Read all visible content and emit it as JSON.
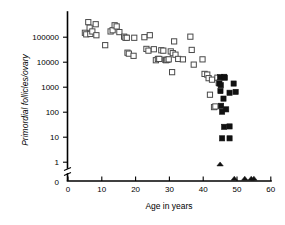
{
  "chart_data": {
    "type": "scatter",
    "title": "",
    "subtitle": "",
    "xlabel": "Age in years",
    "ylabel": "Primordial follicles/ovary",
    "xlim": [
      0,
      60
    ],
    "ylim": [
      0,
      1000000
    ],
    "yscale": "log",
    "y_axis_break": true,
    "y_break_note": "axis broken between 0 and 1",
    "grid": false,
    "legend_position": "none",
    "xticks": [
      0,
      10,
      20,
      30,
      40,
      50,
      60
    ],
    "xticklabels": [
      "0",
      "10",
      "20",
      "30",
      "40",
      "50",
      "60"
    ],
    "yticks": [
      1,
      10,
      100,
      1000,
      10000,
      100000
    ],
    "yticklabels": [
      "1",
      "10",
      "100",
      "1000",
      "10000",
      "100000"
    ],
    "y_zero_label": "0",
    "series": [
      {
        "name": "open-squares",
        "marker": "open-square",
        "color": "#4a4a4a",
        "points": [
          [
            5.0,
            150000
          ],
          [
            5.4,
            130000
          ],
          [
            6.0,
            400000
          ],
          [
            6.4,
            240000
          ],
          [
            6.6,
            135000
          ],
          [
            7.2,
            170000
          ],
          [
            8.2,
            330000
          ],
          [
            8.4,
            120000
          ],
          [
            11.0,
            48000
          ],
          [
            12.6,
            170000
          ],
          [
            13.2,
            190000
          ],
          [
            13.8,
            300000
          ],
          [
            14.4,
            270000
          ],
          [
            15.2,
            160000
          ],
          [
            16.6,
            105000
          ],
          [
            17.0,
            95000
          ],
          [
            17.4,
            95000
          ],
          [
            17.6,
            24000
          ],
          [
            18.0,
            22000
          ],
          [
            19.4,
            18000
          ],
          [
            19.6,
            95000
          ],
          [
            22.6,
            100000
          ],
          [
            23.2,
            34000
          ],
          [
            23.8,
            29000
          ],
          [
            24.2,
            120000
          ],
          [
            25.4,
            33000
          ],
          [
            26.0,
            12000
          ],
          [
            26.6,
            13500
          ],
          [
            27.0,
            13500
          ],
          [
            27.6,
            30000
          ],
          [
            28.2,
            29000
          ],
          [
            28.8,
            12500
          ],
          [
            29.0,
            12000
          ],
          [
            29.4,
            12500
          ],
          [
            29.8,
            13000
          ],
          [
            30.4,
            27000
          ],
          [
            30.8,
            4000
          ],
          [
            31.0,
            23000
          ],
          [
            31.4,
            68000
          ],
          [
            31.8,
            20000
          ],
          [
            32.6,
            13500
          ],
          [
            34.0,
            13000
          ],
          [
            36.2,
            105000
          ],
          [
            36.6,
            31000
          ],
          [
            37.2,
            8000
          ],
          [
            39.8,
            13000
          ],
          [
            40.4,
            3400
          ],
          [
            41.2,
            3200
          ],
          [
            41.6,
            2300
          ],
          [
            42.0,
            500
          ],
          [
            42.6,
            2000
          ],
          [
            43.2,
            160
          ],
          [
            43.6,
            170
          ],
          [
            44.2,
            2400
          ],
          [
            44.6,
            1500
          ]
        ]
      },
      {
        "name": "filled-squares",
        "marker": "filled-square",
        "color": "#111111",
        "points": [
          [
            44.8,
            1400
          ],
          [
            45.0,
            2500
          ],
          [
            45.2,
            1200
          ],
          [
            46.2,
            2600
          ],
          [
            46.4,
            2400
          ],
          [
            45.1,
            700
          ],
          [
            46.0,
            350
          ],
          [
            47.8,
            600
          ],
          [
            49.0,
            1400
          ],
          [
            49.6,
            650
          ],
          [
            45.3,
            180
          ],
          [
            45.6,
            105
          ],
          [
            46.8,
            130
          ],
          [
            46.2,
            26
          ],
          [
            47.8,
            27
          ],
          [
            45.6,
            9
          ],
          [
            47.8,
            9
          ]
        ]
      },
      {
        "name": "triangles-above-zero",
        "marker": "filled-triangle",
        "color": "#111111",
        "points": [
          [
            45.0,
            0.85
          ]
        ]
      },
      {
        "name": "triangles-at-zero",
        "marker": "filled-triangle",
        "color": "#111111",
        "points": [
          [
            49.2,
            0
          ],
          [
            52.3,
            0
          ],
          [
            54.2,
            0
          ],
          [
            55.0,
            0
          ]
        ]
      }
    ]
  },
  "axis": {
    "x_title": "Age in years",
    "y_title": "Primordial follicles/ovary"
  }
}
